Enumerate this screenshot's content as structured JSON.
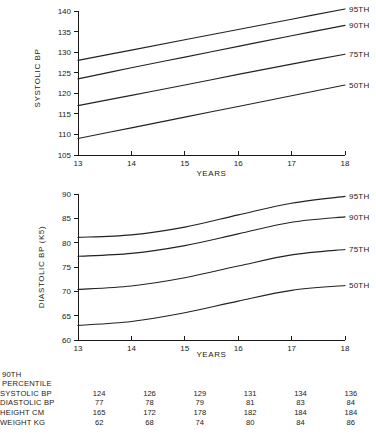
{
  "chart_data": [
    {
      "id": "systolic",
      "type": "line",
      "title": "",
      "xlabel": "YEARS",
      "ylabel": "SYSTOLIC BP",
      "x": [
        13,
        14,
        15,
        16,
        17,
        18
      ],
      "xlim": [
        13,
        18
      ],
      "ylim": [
        105,
        140
      ],
      "yticks": [
        105,
        110,
        115,
        120,
        125,
        130,
        135,
        140
      ],
      "xticks": [
        13,
        14,
        15,
        16,
        17,
        18
      ],
      "grid": false,
      "legend_position": "right-inline",
      "series": [
        {
          "name": "95TH",
          "values": [
            128.0,
            130.5,
            133.0,
            135.5,
            138.0,
            140.5
          ]
        },
        {
          "name": "90TH",
          "values": [
            123.5,
            126.2,
            128.8,
            131.4,
            134.0,
            136.5
          ]
        },
        {
          "name": "75TH",
          "values": [
            117.0,
            119.5,
            122.0,
            124.6,
            127.1,
            129.5
          ]
        },
        {
          "name": "50TH",
          "values": [
            109.0,
            111.6,
            114.2,
            116.8,
            119.4,
            122.0
          ]
        }
      ]
    },
    {
      "id": "diastolic",
      "type": "line",
      "title": "",
      "xlabel": "YEARS",
      "ylabel": "DIASTOLIC BP (K5)",
      "x": [
        13,
        14,
        15,
        16,
        17,
        18
      ],
      "xlim": [
        13,
        18
      ],
      "ylim": [
        60,
        90
      ],
      "yticks": [
        60,
        65,
        70,
        75,
        80,
        85,
        90
      ],
      "xticks": [
        13,
        14,
        15,
        16,
        17,
        18
      ],
      "grid": false,
      "legend_position": "right-inline",
      "series": [
        {
          "name": "95TH",
          "values": [
            81.1,
            81.6,
            83.2,
            85.7,
            88.1,
            89.5
          ]
        },
        {
          "name": "90TH",
          "values": [
            77.2,
            77.8,
            79.4,
            81.8,
            84.2,
            85.3
          ]
        },
        {
          "name": "75TH",
          "values": [
            70.4,
            71.1,
            72.8,
            75.2,
            77.5,
            78.6
          ]
        },
        {
          "name": "50TH",
          "values": [
            63.0,
            63.8,
            65.6,
            68.0,
            70.2,
            71.2
          ]
        }
      ]
    }
  ],
  "table": {
    "heading_line1": "90TH",
    "heading_line2": "PERCENTILE",
    "columns": [
      "13",
      "14",
      "15",
      "16",
      "17",
      "18"
    ],
    "rows": [
      {
        "label": "SYSTOLIC BP",
        "values": [
          "124",
          "126",
          "129",
          "131",
          "134",
          "136"
        ]
      },
      {
        "label": "DIASTOLIC BP",
        "values": [
          "77",
          "78",
          "79",
          "81",
          "83",
          "84"
        ]
      },
      {
        "label": "HEIGHT CM",
        "values": [
          "165",
          "172",
          "178",
          "182",
          "184",
          "184"
        ]
      },
      {
        "label": "WEIGHT KG",
        "values": [
          "62",
          "68",
          "74",
          "80",
          "84",
          "86"
        ]
      }
    ]
  },
  "style": {
    "ink": "#1a1a1a",
    "background": "#ffffff"
  }
}
